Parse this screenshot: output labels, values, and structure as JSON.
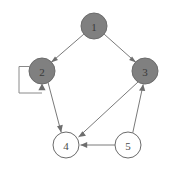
{
  "figure": {
    "type": "directed-graph",
    "width": 176,
    "height": 171,
    "background_color": "#ffffff"
  },
  "style": {
    "filled_node_fill": "#808080",
    "filled_node_text": "#3a3a3a",
    "empty_node_fill": "#ffffff",
    "empty_node_text": "#4a4a4a",
    "node_stroke": "#6b6b6b",
    "edge_color": "#7a7a7a",
    "arrowhead_color": "#6e6e6e",
    "node_radius": 13
  },
  "nodes": [
    {
      "id": "1",
      "label": "1",
      "cx": 94,
      "cy": 26,
      "r": 13,
      "filled": true,
      "fill": "#808080",
      "text_color": "#3a3a3a"
    },
    {
      "id": "2",
      "label": "2",
      "cx": 42,
      "cy": 71,
      "r": 13,
      "filled": true,
      "fill": "#808080",
      "text_color": "#3a3a3a"
    },
    {
      "id": "3",
      "label": "3",
      "cx": 145,
      "cy": 71,
      "r": 13,
      "filled": true,
      "fill": "#808080",
      "text_color": "#3a3a3a"
    },
    {
      "id": "4",
      "label": "4",
      "cx": 66,
      "cy": 145,
      "r": 13,
      "filled": false,
      "fill": "#ffffff",
      "text_color": "#4a4a4a"
    },
    {
      "id": "5",
      "label": "5",
      "cx": 128,
      "cy": 145,
      "r": 13,
      "filled": false,
      "fill": "#ffffff",
      "text_color": "#4a4a4a"
    }
  ],
  "edges": [
    {
      "id": "e-1-2",
      "from": "1",
      "to": "2",
      "directed": true,
      "kind": "straight"
    },
    {
      "id": "e-1-3",
      "from": "1",
      "to": "3",
      "directed": true,
      "kind": "straight"
    },
    {
      "id": "e-2-2",
      "from": "2",
      "to": "2",
      "directed": true,
      "kind": "self-loop",
      "side": "left"
    },
    {
      "id": "e-2-4",
      "from": "2",
      "to": "4",
      "directed": true,
      "kind": "straight"
    },
    {
      "id": "e-3-4",
      "from": "3",
      "to": "4",
      "directed": true,
      "kind": "straight"
    },
    {
      "id": "e-5-3",
      "from": "5",
      "to": "3",
      "directed": true,
      "kind": "straight"
    },
    {
      "id": "e-5-4",
      "from": "5",
      "to": "4",
      "directed": true,
      "kind": "straight"
    }
  ]
}
